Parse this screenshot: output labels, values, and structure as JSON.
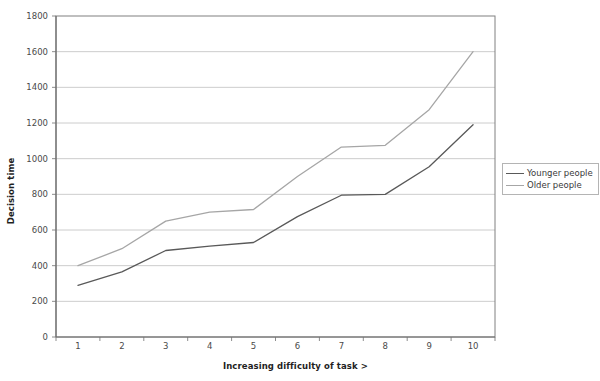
{
  "chart_data": {
    "type": "line",
    "title": "",
    "xlabel": "Increasing difficulty of task >",
    "ylabel": "Decision time",
    "categories": [
      1,
      2,
      3,
      4,
      5,
      6,
      7,
      8,
      9,
      10
    ],
    "x_tick_labels": [
      "1",
      "2",
      "3",
      "4",
      "5",
      "6",
      "7",
      "8",
      "9",
      "10"
    ],
    "y_tick_labels": [
      "0",
      "200",
      "400",
      "600",
      "800",
      "1000",
      "1200",
      "1400",
      "1600",
      "1800"
    ],
    "y_ticks": [
      0,
      200,
      400,
      600,
      800,
      1000,
      1200,
      1400,
      1600,
      1800
    ],
    "ylim": [
      0,
      1800
    ],
    "grid": true,
    "grid_axis": "y",
    "legend_position": "right",
    "series": [
      {
        "name": "Younger people",
        "color": "#595959",
        "values": [
          290,
          365,
          485,
          510,
          530,
          675,
          795,
          800,
          955,
          1190
        ]
      },
      {
        "name": "Older people",
        "color": "#a6a6a6",
        "values": [
          400,
          495,
          650,
          700,
          715,
          900,
          1065,
          1075,
          1275,
          1600
        ]
      }
    ]
  },
  "legend": {
    "items": [
      {
        "label": "Younger people",
        "color": "#595959"
      },
      {
        "label": "Older people",
        "color": "#a6a6a6"
      }
    ]
  },
  "colors": {
    "axis": "#808080",
    "gridline": "#bfbfbf",
    "plot_border": "#808080",
    "text": "#3a3a3a",
    "title_text": "#1f1f1f",
    "background": "#ffffff"
  }
}
